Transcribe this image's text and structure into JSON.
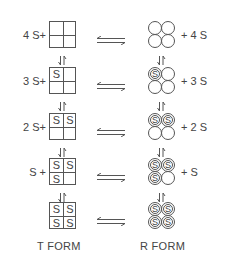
{
  "rows": [
    {
      "t_prefix": "4 S+",
      "t_cells": [
        "",
        "",
        "",
        ""
      ],
      "r_cells": [
        "",
        "",
        "",
        ""
      ],
      "r_suffix": "+ 4 S"
    },
    {
      "t_prefix": "3 S+",
      "t_cells": [
        "S",
        "",
        "",
        ""
      ],
      "r_cells": [
        "S",
        "",
        "",
        ""
      ],
      "r_suffix": "+ 3 S"
    },
    {
      "t_prefix": "2 S+",
      "t_cells": [
        "S",
        "S",
        "",
        ""
      ],
      "r_cells": [
        "S",
        "S",
        "",
        ""
      ],
      "r_suffix": "+ 2 S"
    },
    {
      "t_prefix": "S +",
      "t_cells": [
        "S",
        "S",
        "S",
        ""
      ],
      "r_cells": [
        "S",
        "S",
        "S",
        ""
      ],
      "r_suffix": "+ S"
    },
    {
      "t_prefix": "",
      "t_cells": [
        "S",
        "S",
        "S",
        "S"
      ],
      "r_cells": [
        "S",
        "S",
        "S",
        "S"
      ],
      "r_suffix": ""
    }
  ],
  "equilibrium_symbol": "⇌",
  "vertical_equilibrium_symbol": "⇅",
  "labels": {
    "t_form": "T   FORM",
    "r_form": "R   FORM"
  }
}
